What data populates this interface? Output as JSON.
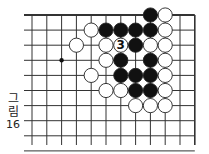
{
  "figure": {
    "label_line1": "그",
    "label_line2": "림",
    "label_line3": "16"
  },
  "board": {
    "origin_x": 32,
    "origin_y": 15,
    "spacing_x": 14.8,
    "spacing_y": 15.1,
    "cols": 12,
    "rows": 10,
    "line_left_x": 24,
    "line_bottom_y": 145,
    "top_edge": true,
    "right_edge": true,
    "line_color": "#333333",
    "star_points": [
      {
        "col": 2,
        "row": 3
      }
    ],
    "stones": [
      {
        "col": 8,
        "row": 0,
        "color": "black"
      },
      {
        "col": 9,
        "row": 0,
        "color": "white"
      },
      {
        "col": 4,
        "row": 1,
        "color": "white"
      },
      {
        "col": 5,
        "row": 1,
        "color": "black"
      },
      {
        "col": 6,
        "row": 1,
        "color": "black"
      },
      {
        "col": 7,
        "row": 1,
        "color": "black"
      },
      {
        "col": 8,
        "row": 1,
        "color": "black"
      },
      {
        "col": 9,
        "row": 1,
        "color": "white"
      },
      {
        "col": 3,
        "row": 2,
        "color": "white"
      },
      {
        "col": 5,
        "row": 2,
        "color": "white"
      },
      {
        "col": 6,
        "row": 2,
        "color": "white",
        "number": "3"
      },
      {
        "col": 7,
        "row": 2,
        "color": "black"
      },
      {
        "col": 8,
        "row": 2,
        "color": "white"
      },
      {
        "col": 9,
        "row": 2,
        "color": "white"
      },
      {
        "col": 5,
        "row": 3,
        "color": "white"
      },
      {
        "col": 6,
        "row": 3,
        "color": "black"
      },
      {
        "col": 8,
        "row": 3,
        "color": "black"
      },
      {
        "col": 9,
        "row": 3,
        "color": "white"
      },
      {
        "col": 4,
        "row": 4,
        "color": "white"
      },
      {
        "col": 6,
        "row": 4,
        "color": "black"
      },
      {
        "col": 7,
        "row": 4,
        "color": "black"
      },
      {
        "col": 8,
        "row": 4,
        "color": "black"
      },
      {
        "col": 9,
        "row": 4,
        "color": "white"
      },
      {
        "col": 5,
        "row": 5,
        "color": "white"
      },
      {
        "col": 6,
        "row": 5,
        "color": "white"
      },
      {
        "col": 7,
        "row": 5,
        "color": "black"
      },
      {
        "col": 8,
        "row": 5,
        "color": "black"
      },
      {
        "col": 9,
        "row": 5,
        "color": "white"
      },
      {
        "col": 7,
        "row": 6,
        "color": "white"
      },
      {
        "col": 8,
        "row": 6,
        "color": "white"
      },
      {
        "col": 9,
        "row": 6,
        "color": "white"
      }
    ]
  }
}
